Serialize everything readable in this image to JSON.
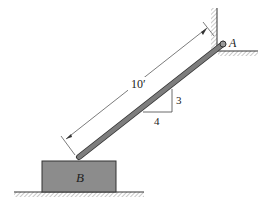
{
  "diagram": {
    "labels": {
      "pin": "A",
      "block": "B",
      "length": "10′",
      "slope_rise": "3",
      "slope_run": "4"
    },
    "colors": {
      "rod": "#7d7d7d",
      "block": "#8c8c8c",
      "line": "#333333",
      "hatch": "#666666"
    }
  }
}
